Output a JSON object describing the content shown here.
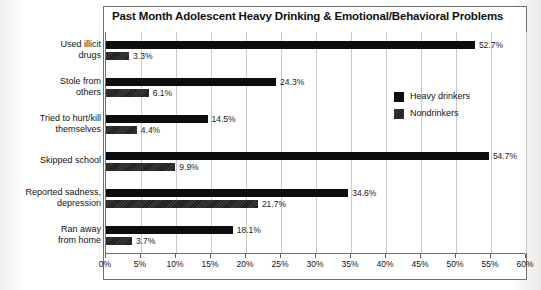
{
  "chart_data": {
    "type": "bar",
    "orientation": "horizontal",
    "title": "Past Month Adolescent Heavy Drinking & Emotional/Behavioral Problems",
    "xlabel": "",
    "ylabel": "",
    "xlim": [
      0,
      60
    ],
    "xtick_step": 5,
    "xticks": [
      "0%",
      "5%",
      "10%",
      "15%",
      "20%",
      "25%",
      "30%",
      "35%",
      "40%",
      "45%",
      "50%",
      "55%",
      "60%"
    ],
    "xtick_values": [
      0,
      5,
      10,
      15,
      20,
      25,
      30,
      35,
      40,
      45,
      50,
      55,
      60
    ],
    "grid": true,
    "grid_axis": "x",
    "legend_position": "top-right-inside",
    "value_suffix": "%",
    "categories": [
      "Used illicit\ndrugs",
      "Stole from\nothers",
      "Tried to hurt/kill\nthemselves",
      "Skipped school",
      "Reported sadness,\ndepression",
      "Ran away\nfrom home"
    ],
    "series": [
      {
        "name": "Heavy drinkers",
        "color": "#0d0d0d",
        "values": [
          52.7,
          24.3,
          14.5,
          54.7,
          34.6,
          18.1
        ],
        "labels": [
          "52.7%",
          "24.3%",
          "14.5%",
          "54.7%",
          "34.6%",
          "18.1%"
        ]
      },
      {
        "name": "Nondrinkers",
        "color": "#2b2b2b",
        "values": [
          3.3,
          6.1,
          4.4,
          9.9,
          21.7,
          3.7
        ],
        "labels": [
          "3.3%",
          "6.1%",
          "4.4%",
          "9.9%",
          "21.7%",
          "3.7%"
        ]
      }
    ]
  },
  "legend": {
    "items": [
      {
        "label": "Heavy drinkers"
      },
      {
        "label": "Nondrinkers"
      }
    ]
  }
}
